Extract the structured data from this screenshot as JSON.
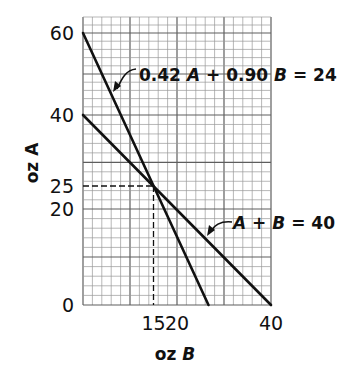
{
  "chart_data": {
    "type": "line",
    "title": "",
    "xlabel": "oz B",
    "ylabel": "oz A",
    "xlim": [
      0,
      40
    ],
    "ylim": [
      0,
      64
    ],
    "grid": true,
    "grid_minor_step": 2,
    "grid_major_step": 10,
    "x_ticks": [
      {
        "value": 15,
        "label": "15"
      },
      {
        "value": 20,
        "label": "20"
      },
      {
        "value": 40,
        "label": "40"
      }
    ],
    "y_ticks": [
      {
        "value": 0,
        "label": "0"
      },
      {
        "value": 20,
        "label": "20"
      },
      {
        "value": 25,
        "label": "25"
      },
      {
        "value": 40,
        "label": "40"
      },
      {
        "value": 60,
        "label": "60"
      }
    ],
    "series": [
      {
        "name": "0.42 A + 0.90 B = 24",
        "label_parts": [
          "0.42 ",
          "A",
          " + 0.90 ",
          "B",
          " = 24"
        ],
        "points": [
          [
            0,
            60
          ],
          [
            26.7,
            0
          ]
        ]
      },
      {
        "name": "A + B = 40",
        "label_parts": [
          "",
          "A",
          " + ",
          "B",
          " = 40"
        ],
        "points": [
          [
            0,
            40
          ],
          [
            40,
            0
          ]
        ]
      }
    ],
    "annotations": [
      {
        "type": "intersection",
        "x": 15,
        "y": 25,
        "style": "dashed guide lines"
      }
    ],
    "colors": {
      "line": "#111111",
      "grid_minor": "#9a9a9a",
      "grid_major": "#5e5e5e"
    }
  }
}
